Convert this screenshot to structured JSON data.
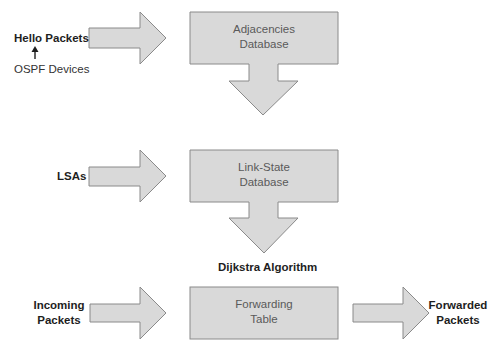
{
  "diagram": {
    "colors": {
      "shape_fill": "#d9d9d9",
      "shape_stroke": "#8a8a8a",
      "label_text": "#1e1e1e",
      "box_text": "#5a5a5a"
    },
    "inputs": {
      "hello_packets": "Hello Packets",
      "ospf_devices": "OSPF Devices",
      "lsas": "LSAs",
      "incoming_packets_line1": "Incoming",
      "incoming_packets_line2": "Packets"
    },
    "boxes": {
      "adjacencies_line1": "Adjacencies",
      "adjacencies_line2": "Database",
      "link_state_line1": "Link-State",
      "link_state_line2": "Database",
      "forwarding_line1": "Forwarding",
      "forwarding_line2": "Table"
    },
    "process_label": "Dijkstra Algorithm",
    "output": {
      "line1": "Forwarded",
      "line2": "Packets"
    }
  }
}
